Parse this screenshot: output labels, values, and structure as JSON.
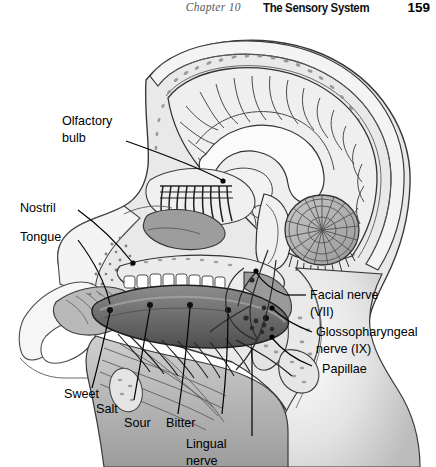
{
  "running_head": {
    "chapter": "Chapter 10",
    "section_title": "The Sensory System",
    "page_number": "159"
  },
  "figure": {
    "labels": {
      "olfactory_bulb_1": "Olfactory",
      "olfactory_bulb_2": "bulb",
      "nostril": "Nostril",
      "tongue": "Tongue",
      "facial_nerve_1": "Facial nerve",
      "facial_nerve_2": "(VII)",
      "glossopharyngeal_1": "Glossopharyngeal",
      "glossopharyngeal_2": "nerve (IX)",
      "papillae": "Papillae",
      "sweet": "Sweet",
      "salt": "Salt",
      "sour": "Sour",
      "bitter": "Bitter",
      "lingual_1": "Lingual",
      "lingual_2": "nerve"
    },
    "colors": {
      "outline": "#231f20",
      "skin": "#e8e8e8",
      "skull": "#f2f2f2",
      "brain": "#ededed",
      "tongue": "#7c7c7c",
      "tongue_dark": "#5a5a5a",
      "cerebellum": "#b5b5b5",
      "mucosa": "#a8a8a8",
      "teeth": "#ffffff",
      "leader": "#000000"
    }
  }
}
